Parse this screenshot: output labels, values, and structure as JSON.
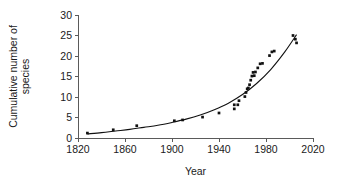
{
  "chart_data": {
    "type": "scatter",
    "title": "",
    "xlabel": "Year",
    "ylabel": "Cumulative number of species",
    "ylabel_lines": [
      "Cumulative number of",
      "species"
    ],
    "xlim": [
      1820,
      2020
    ],
    "ylim": [
      0,
      30
    ],
    "xticks": [
      1820,
      1860,
      1900,
      1940,
      1980,
      2020
    ],
    "xtick_labels": [
      "1820",
      "1860",
      "1900",
      "1940",
      "1980",
      "2020"
    ],
    "yticks": [
      0,
      5,
      10,
      15,
      20,
      25,
      30
    ],
    "ytick_labels": [
      "0",
      "5",
      "10",
      "15",
      "20",
      "25",
      "30"
    ],
    "grid": false,
    "legend": false,
    "legend_position": "none",
    "marker": "filled-square",
    "marker_color": "#111111",
    "curve_color": "#111111",
    "axis_color": "#5a5a5a",
    "series": [
      {
        "name": "Cumulative number of species",
        "marker": "filled-square",
        "x": [
          1828,
          1850,
          1870,
          1902,
          1909,
          1926,
          1940,
          1953,
          1953,
          1956,
          1957,
          1962,
          1963,
          1964,
          1965,
          1966,
          1967,
          1968,
          1969,
          1970,
          1971,
          1973,
          1975,
          1977,
          1983,
          1985,
          1987,
          2003,
          2005,
          2006
        ],
        "y": [
          1.2,
          2.0,
          3.0,
          4.2,
          4.4,
          5.1,
          6.1,
          7.1,
          8.1,
          8.1,
          9.1,
          10.1,
          11.1,
          12.0,
          12.2,
          13.0,
          14.1,
          15.1,
          16.0,
          15.2,
          16.1,
          17.1,
          18.1,
          18.2,
          20.1,
          21.0,
          21.2,
          25.0,
          24.1,
          23.2
        ]
      }
    ],
    "fit_curve": {
      "name": "exponential fit",
      "x": [
        1828,
        1840,
        1852,
        1864,
        1876,
        1888,
        1900,
        1912,
        1924,
        1936,
        1948,
        1960,
        1972,
        1984,
        1996,
        2006
      ],
      "y": [
        1.0,
        1.3,
        1.7,
        2.1,
        2.6,
        3.1,
        3.8,
        4.6,
        5.6,
        6.9,
        8.5,
        10.6,
        13.3,
        16.7,
        21.0,
        25.2
      ]
    }
  }
}
